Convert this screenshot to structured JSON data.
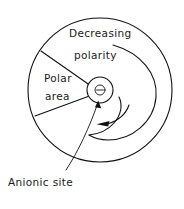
{
  "diagram": {
    "title_absent": true,
    "labels": {
      "decreasing_line1": "Decreasing",
      "decreasing_line2": "polarity",
      "polar_line1": "Polar",
      "polar_line2": "area",
      "anionic": "Anionic site",
      "charge_symbol": "⊖"
    },
    "colors": {
      "stroke": "#111111",
      "background": "#ffffff",
      "text": "#1a1a1a"
    },
    "geometry": {
      "outer_circle": {
        "cx": 100,
        "cy": 90,
        "r": 72
      },
      "center_circle": {
        "cx": 100,
        "cy": 90,
        "r": 13
      },
      "spiral_start": {
        "x": 113,
        "y": 45
      },
      "spiral_arrow_tip": {
        "x": 99,
        "y": 124
      },
      "wedge_upper_outer": {
        "x": 41,
        "y": 51
      },
      "wedge_lower_outer": {
        "x": 35,
        "y": 116
      },
      "leader_from": {
        "x": 66,
        "y": 170
      },
      "leader_to": {
        "x": 98,
        "y": 101
      }
    },
    "icon_names": {
      "charge": "circled-minus-icon",
      "rotation": "counterclockwise-spiral-arrow-icon",
      "pointer": "leader-line-arrow-icon"
    }
  }
}
